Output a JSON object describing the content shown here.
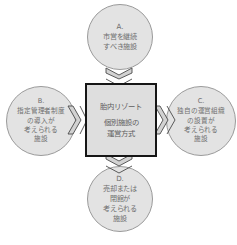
{
  "diagram": {
    "type": "radial-relationship-diagram",
    "background_color": "#ffffff",
    "center": {
      "title": "胎内リゾート",
      "subtitle_line1": "個別施設の",
      "subtitle_line2": "運営方式",
      "fill_color": "#dedede",
      "border_color": "#161616"
    },
    "nodes": [
      {
        "id": "A",
        "position": "top",
        "label": "A.",
        "line1": "市営を継続",
        "line2": "すべき施設",
        "line3": "",
        "line4": "",
        "fill_color": "#e3e3e3",
        "border_color": "#9a9a9a"
      },
      {
        "id": "B",
        "position": "left",
        "label": "B.",
        "line1": "指定管理者制度",
        "line2": "の導入が",
        "line3": "考えられる",
        "line4": "施設",
        "fill_color": "#e3e3e3",
        "border_color": "#9a9a9a"
      },
      {
        "id": "C",
        "position": "right",
        "label": "C.",
        "line1": "独自の運営組織",
        "line2": "の設置が",
        "line3": "考えられる",
        "line4": "施設",
        "fill_color": "#e3e3e3",
        "border_color": "#9a9a9a"
      },
      {
        "id": "D",
        "position": "bottom",
        "label": "D.",
        "line1": "売却または",
        "line2": "閉館が",
        "line3": "考えられる",
        "line4": "施設",
        "fill_color": "#e3e3e3",
        "border_color": "#9a9a9a"
      }
    ],
    "connectors": [
      {
        "id": "connector-top",
        "icon": "double-arrow-vertical-icon"
      },
      {
        "id": "connector-bottom",
        "icon": "double-arrow-vertical-icon"
      },
      {
        "id": "connector-left",
        "icon": "double-arrow-horizontal-icon"
      },
      {
        "id": "connector-right",
        "icon": "double-arrow-horizontal-icon"
      }
    ],
    "caption": ""
  }
}
